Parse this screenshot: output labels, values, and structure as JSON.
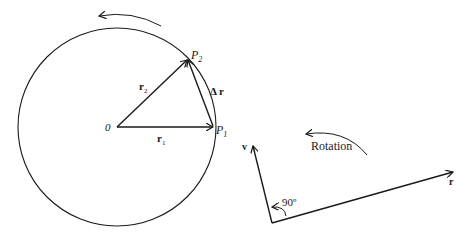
{
  "figure": {
    "left_diagram": {
      "origin_label": "0",
      "point1_label": "P",
      "point1_sub": "1",
      "point2_label": "P",
      "point2_sub": "2",
      "vector1_label": "r",
      "vector1_sub": "1",
      "vector2_label": "r",
      "vector2_sub": "2",
      "delta_label": "Δ r",
      "rotation_arrow": "counterclockwise"
    },
    "right_diagram": {
      "velocity_label": "v",
      "radius_label": "r",
      "angle_label": "90º",
      "rotation_label": "Rotation"
    },
    "colors": {
      "stroke": "#1a1a1a",
      "background": "#ffffff"
    }
  }
}
